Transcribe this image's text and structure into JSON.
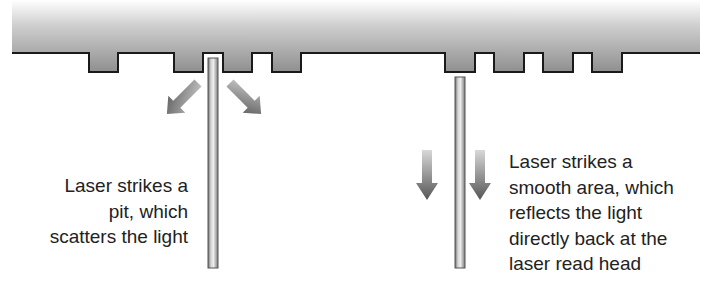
{
  "diagram": {
    "type": "optical-disc-readout",
    "surface": {
      "label": "disc-surface",
      "pit_count": 8,
      "colors": {
        "gradient_top": "#ffffff",
        "gradient_bottom": "#8f8f8f",
        "outline": "#1a1a1a"
      }
    },
    "left_scenario": {
      "beam": "laser-beam-pit",
      "arrows": [
        "scatter-arrow-left",
        "scatter-arrow-right"
      ],
      "caption": {
        "lines": [
          "Laser strikes a",
          "pit, which",
          "scatters the light"
        ]
      }
    },
    "right_scenario": {
      "beam": "laser-beam-land",
      "arrows": [
        "reflect-arrow-left",
        "reflect-arrow-right"
      ],
      "caption": {
        "lines": [
          "Laser strikes a",
          "smooth area, which",
          "reflects the light",
          "directly back at the",
          "laser read head"
        ]
      }
    }
  }
}
